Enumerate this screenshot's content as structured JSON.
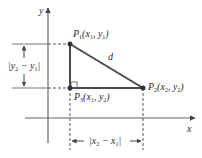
{
  "diagram": {
    "axes": {
      "x_label": "x",
      "y_label": "y"
    },
    "points": {
      "p1": {
        "name": "P",
        "index": "1",
        "coords_open": "(x",
        "c1_sub": "1",
        "sep": ", y",
        "c2_sub": "1",
        "close": ")"
      },
      "p2": {
        "name": "P",
        "index": "2",
        "coords_open": "(x",
        "c1_sub": "2",
        "sep": ", y",
        "c2_sub": "2",
        "close": ")"
      },
      "p3": {
        "name": "P",
        "index": "3",
        "coords_open": "(x",
        "c1_sub": "1",
        "sep": ", y",
        "c2_sub": "2",
        "close": ")"
      }
    },
    "hypotenuse_label": "d",
    "vertical_dimension": {
      "open": "|y",
      "a_sub": "2",
      "mid": " − y",
      "b_sub": "1",
      "close": "|"
    },
    "horizontal_dimension": {
      "open": "|x",
      "a_sub": "2",
      "mid": " − x",
      "b_sub": "1",
      "close": "|"
    },
    "colors": {
      "line": "#555555",
      "triangle": "#4a4a4a",
      "text": "#2a2a2a"
    }
  }
}
